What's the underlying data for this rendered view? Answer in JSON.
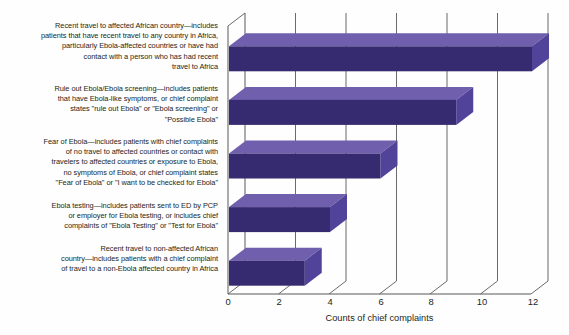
{
  "chart_data": {
    "type": "bar",
    "orientation": "horizontal",
    "title": "",
    "xlabel": "Counts of chief complaints",
    "ylabel": "",
    "xlim": [
      0,
      12
    ],
    "xticks": [
      0,
      2,
      4,
      6,
      8,
      10,
      12
    ],
    "grid": true,
    "legend": "none",
    "style": "3d-horizontal-bar",
    "colors": {
      "bar_front": "#362b70",
      "bar_top": "#6f5fad",
      "bar_side": "#51439a",
      "axis": "#58595b",
      "gridline": "#58595b",
      "background": "#fefefe",
      "text": "#231f20"
    },
    "categories": [
      "Recent travel to affected African country—includes\npatients that have recent travel to any country in Africa,\nparticularly Ebola-affected countries or have had\ncontact with a person who has had recent\ntravel to Africa",
      "Rule out Ebola/Ebola screening—includes patients\nthat have Ebola-like symptoms, or chief complaint\nstates \"rule out Ebola\" or \"Ebola screening\" or\n\"Possible Ebola\"",
      "Fear of Ebola—includes patients with chief complaints\nof no travel to affected countries or contact with\ntravelers to affected countries or exposure to Ebola,\nno symptoms of Ebola, or chief complaint states\n\"Fear of Ebola\" or \"I want to be checked for Ebola\"",
      "Ebola testing—includes patients sent to ED by PCP\nor employer for Ebola testing, or includes chief\ncomplaints of \"Ebola Testing\" or \"Test for Ebola\"",
      "Recent travel to non-affected African\ncountry—includes patients with a chief complaint\nof travel to a non-Ebola affected country in Africa"
    ],
    "values": [
      12,
      9,
      6,
      4,
      3
    ]
  },
  "axis": {
    "tick_labels": [
      "0",
      "2",
      "4",
      "6",
      "8",
      "10",
      "12"
    ],
    "x_title": "Counts of chief complaints"
  }
}
